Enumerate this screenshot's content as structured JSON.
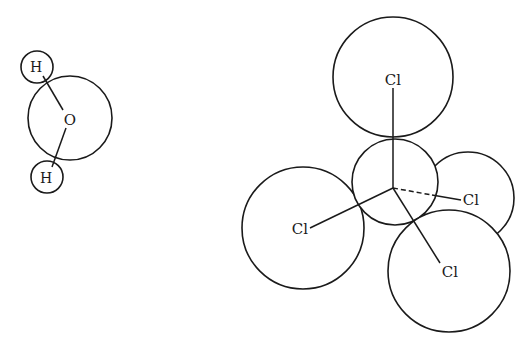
{
  "diagram": {
    "molecules": [
      {
        "name": "water",
        "atoms": [
          {
            "symbol": "O",
            "label": "O",
            "cx": 70,
            "cy": 118,
            "r": 42
          },
          {
            "symbol": "H",
            "label": "H",
            "cx": 37,
            "cy": 67,
            "r": 16
          },
          {
            "symbol": "H",
            "label": "H",
            "cx": 47,
            "cy": 177,
            "r": 16
          }
        ],
        "bonds": [
          {
            "from": "H-top",
            "to": "O",
            "style": "solid"
          },
          {
            "from": "H-bottom",
            "to": "O",
            "style": "solid"
          }
        ]
      },
      {
        "name": "carbon-tetrachloride",
        "atoms": [
          {
            "symbol": "C",
            "label": "",
            "cx": 395,
            "cy": 182,
            "r": 43
          },
          {
            "symbol": "Cl",
            "label": "Cl",
            "cx": 393,
            "cy": 77,
            "r": 60,
            "position": "top"
          },
          {
            "symbol": "Cl",
            "label": "Cl",
            "cx": 468,
            "cy": 198,
            "r": 46,
            "position": "right-back"
          },
          {
            "symbol": "Cl",
            "label": "Cl",
            "cx": 303,
            "cy": 228,
            "r": 61,
            "position": "left"
          },
          {
            "symbol": "Cl",
            "label": "Cl",
            "cx": 449,
            "cy": 271,
            "r": 61,
            "position": "bottom-right"
          }
        ],
        "bonds": [
          {
            "to": "Cl-top",
            "style": "solid"
          },
          {
            "to": "Cl-right",
            "style": "dashed-then-solid"
          },
          {
            "to": "Cl-left",
            "style": "solid"
          },
          {
            "to": "Cl-bottom",
            "style": "solid"
          }
        ]
      }
    ],
    "labels": {
      "water_o": "O",
      "water_h1": "H",
      "water_h2": "H",
      "ccl4_top": "Cl",
      "ccl4_right": "Cl",
      "ccl4_left": "Cl",
      "ccl4_bottom": "Cl"
    },
    "colors": {
      "stroke": "#1a1a1a",
      "background": "#ffffff"
    }
  }
}
